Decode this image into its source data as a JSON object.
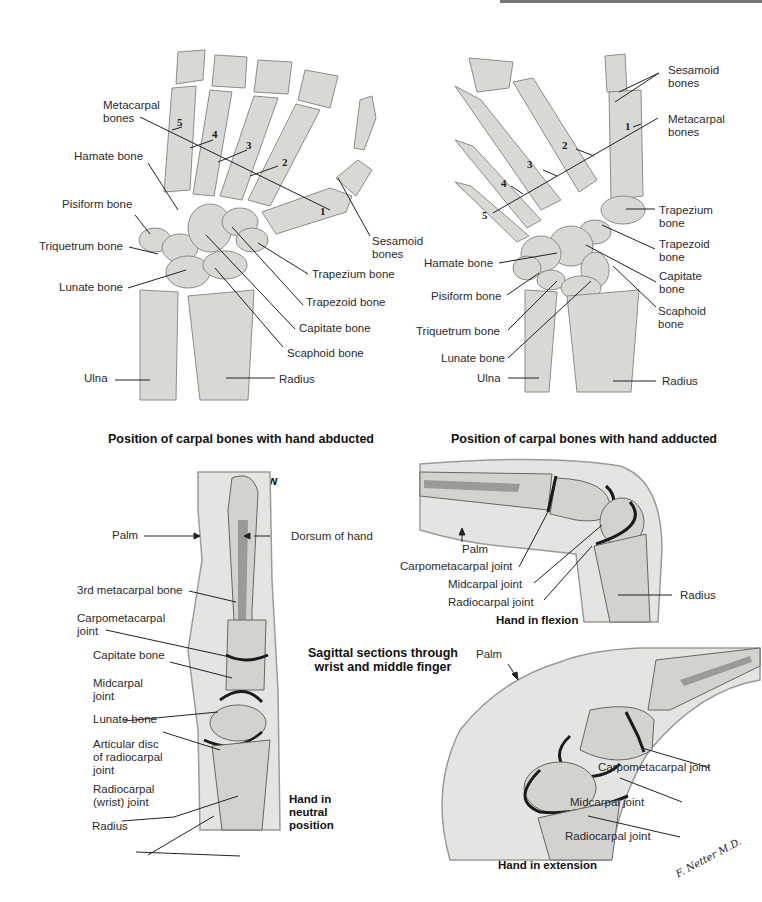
{
  "panels": {
    "abducted": {
      "caption_line1": "Position of carpal bones with hand abducted",
      "caption_line2": "anterior view",
      "labels": {
        "metacarpal": "Metacarpal\nbones",
        "hamate": "Hamate bone",
        "pisiform": "Pisiform bone",
        "triquetrum": "Triquetrum bone",
        "lunate": "Lunate bone",
        "ulna": "Ulna",
        "radius": "Radius",
        "scaphoid": "Scaphoid bone",
        "capitate": "Capitate bone",
        "trapezoid": "Trapezoid bone",
        "trapezium": "Trapezium bone",
        "sesamoid": "Sesamoid\nbones"
      },
      "numbers": [
        "1",
        "2",
        "3",
        "4",
        "5"
      ]
    },
    "adducted": {
      "caption_line1": "Position of carpal bones with hand adducted",
      "caption_line2": "anterior view",
      "labels": {
        "sesamoid": "Sesamoid\nbones",
        "metacarpal": "Metacarpal\nbones",
        "trapezium": "Trapezium\nbone",
        "trapezoid": "Trapezoid\nbone",
        "capitate": "Capitate\nbone",
        "scaphoid": "Scaphoid\nbone",
        "hamate": "Hamate bone",
        "pisiform": "Pisiform bone",
        "triquetrum": "Triquetrum bone",
        "lunate": "Lunate bone",
        "ulna": "Ulna",
        "radius": "Radius"
      },
      "numbers": [
        "1",
        "2",
        "3",
        "4",
        "5"
      ]
    },
    "neutral": {
      "caption": "Hand in\nneutral\nposition",
      "labels": {
        "palm": "Palm",
        "dorsum": "Dorsum of hand",
        "third_metacarpal": "3rd metacarpal bone",
        "carpometacarpal": "Carpometacarpal\njoint",
        "capitate": "Capitate bone",
        "midcarpal": "Midcarpal\njoint",
        "lunate": "Lunate bone",
        "articular_disc": "Articular disc\nof radiocarpal\njoint",
        "radiocarpal": "Radiocarpal\n(wrist) joint",
        "radius": "Radius"
      }
    },
    "flexion": {
      "caption": "Hand in flexion",
      "labels": {
        "palm": "Palm",
        "carpometacarpal": "Carpometacarpal joint",
        "midcarpal": "Midcarpal joint",
        "radiocarpal": "Radiocarpal joint",
        "radius": "Radius"
      }
    },
    "sagittal_title": "Sagittal sections through\nwrist and middle finger",
    "extension": {
      "caption": "Hand in extension",
      "labels": {
        "palm": "Palm",
        "carpometacarpal": "Carpometacarpal joint",
        "midcarpal": "Midcarpal joint",
        "radiocarpal": "Radiocarpal joint"
      }
    }
  },
  "signature": "F. Netter M.D.",
  "colors": {
    "bone": "#d9d9d6",
    "bone_shade": "#a9a9a6",
    "soft_tissue": "#e6e6e4",
    "joint_line": "#1a1a1a",
    "text": "#231f20"
  }
}
